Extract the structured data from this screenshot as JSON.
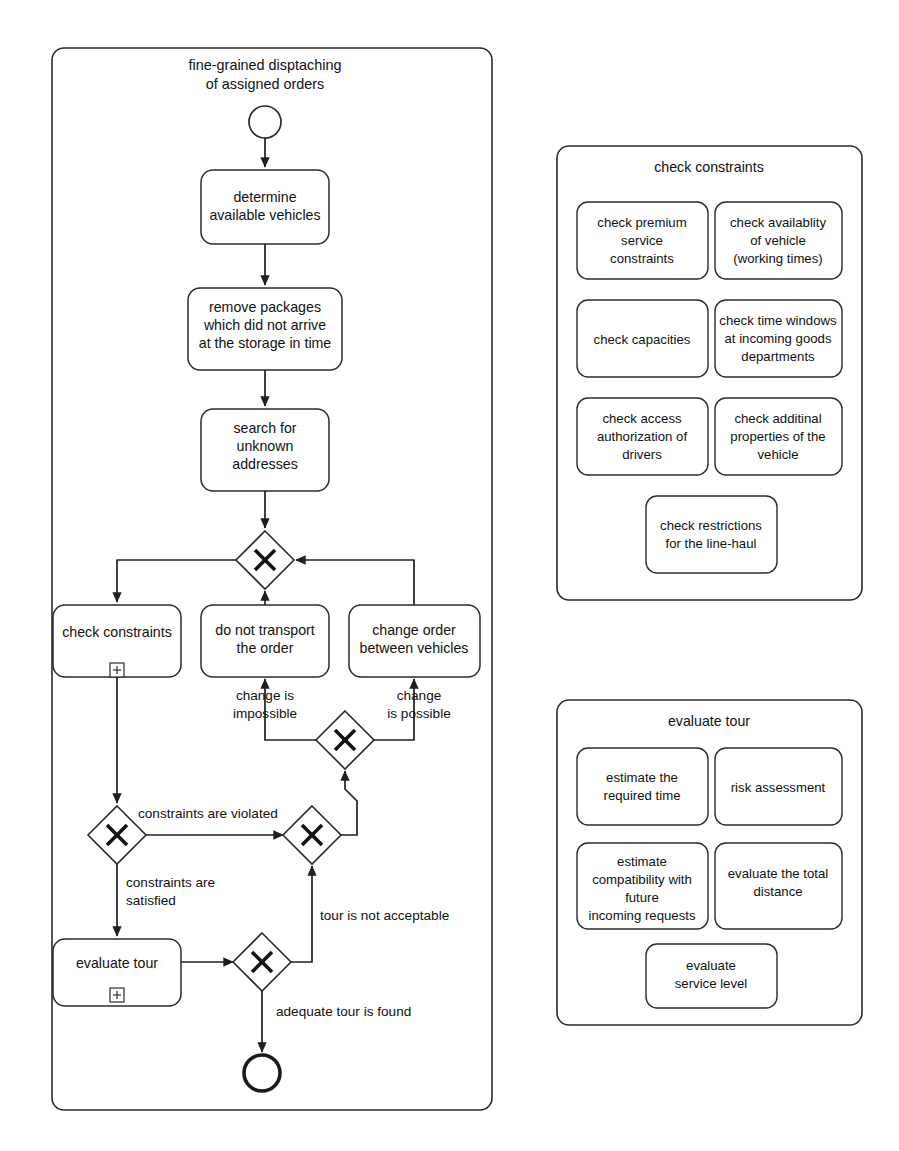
{
  "diagram": {
    "type": "bpmn-process-diagram",
    "pool": {
      "title_line1": "fine-grained disptaching",
      "title_line2": "of assigned orders",
      "start_event_name": "start-event",
      "end_event_name": "end-event"
    },
    "tasks": [
      {
        "id": "determine_vehicles",
        "lines": [
          "determine",
          "available vehicles"
        ],
        "marker": ""
      },
      {
        "id": "remove_packages",
        "lines": [
          "remove packages",
          "which did not arrive",
          "at the storage in time"
        ],
        "marker": ""
      },
      {
        "id": "search_addresses",
        "lines": [
          "search for",
          "unknown",
          "addresses"
        ],
        "marker": ""
      },
      {
        "id": "check_constraints",
        "lines": [
          "check  constraints"
        ],
        "marker": "+"
      },
      {
        "id": "do_not_transport",
        "lines": [
          "do not transport",
          "the order"
        ],
        "marker": ""
      },
      {
        "id": "change_order",
        "lines": [
          "change order",
          "between vehicles"
        ],
        "marker": ""
      },
      {
        "id": "evaluate_tour",
        "lines": [
          "evaluate tour"
        ],
        "marker": "+"
      }
    ],
    "gateways": [
      {
        "id": "gw_split_main",
        "symbol": "X",
        "kind": "exclusive"
      },
      {
        "id": "gw_change_possible",
        "symbol": "X",
        "kind": "exclusive"
      },
      {
        "id": "gw_constraints",
        "symbol": "X",
        "kind": "exclusive"
      },
      {
        "id": "gw_merge_loop",
        "symbol": "X",
        "kind": "exclusive"
      },
      {
        "id": "gw_tour_ok",
        "symbol": "X",
        "kind": "exclusive"
      }
    ],
    "edge_labels": [
      {
        "id": "change_impossible",
        "lines": [
          "change is",
          "impossible"
        ]
      },
      {
        "id": "change_possible",
        "lines": [
          "change",
          "is possible"
        ]
      },
      {
        "id": "constraints_violated",
        "lines": [
          "constraints are violated"
        ]
      },
      {
        "id": "constraints_satisfied",
        "lines": [
          "constraints are",
          "satisfied"
        ]
      },
      {
        "id": "tour_not_acceptable",
        "lines": [
          "tour is not acceptable"
        ]
      },
      {
        "id": "adequate_tour_found",
        "lines": [
          "adequate tour is found"
        ]
      }
    ],
    "panels": [
      {
        "id": "panel_check_constraints",
        "title": "check constraints",
        "subtasks": [
          {
            "id": "check_premium",
            "lines": [
              "check premium",
              "service",
              "constraints"
            ]
          },
          {
            "id": "check_availability",
            "lines": [
              "check availablity",
              "of vehicle",
              "(working times)"
            ]
          },
          {
            "id": "check_capacities",
            "lines": [
              "check capacities"
            ]
          },
          {
            "id": "check_time_windows",
            "lines": [
              "check time windows",
              "at incoming goods",
              "departments"
            ]
          },
          {
            "id": "check_access",
            "lines": [
              "check access",
              "authorization of",
              "drivers"
            ]
          },
          {
            "id": "check_additional",
            "lines": [
              "check additinal",
              "properties of the",
              "vehicle"
            ]
          },
          {
            "id": "check_restrictions",
            "lines": [
              "check restrictions",
              "for the line-haul"
            ]
          }
        ]
      },
      {
        "id": "panel_evaluate_tour",
        "title": "evaluate tour",
        "subtasks": [
          {
            "id": "estimate_time",
            "lines": [
              "estimate the",
              "required time"
            ]
          },
          {
            "id": "risk_assessment",
            "lines": [
              "risk assessment"
            ]
          },
          {
            "id": "estimate_compatibility",
            "lines": [
              "estimate",
              "compatibility with",
              "future",
              "incoming requests"
            ]
          },
          {
            "id": "evaluate_distance",
            "lines": [
              "evaluate the total",
              "distance"
            ]
          },
          {
            "id": "evaluate_service_level",
            "lines": [
              "evaluate",
              "service level"
            ]
          }
        ]
      }
    ],
    "colors": {
      "stroke": "#2b2b2b",
      "flow": "#1f1f1f",
      "background": "#ffffff",
      "text": "#111111"
    }
  }
}
